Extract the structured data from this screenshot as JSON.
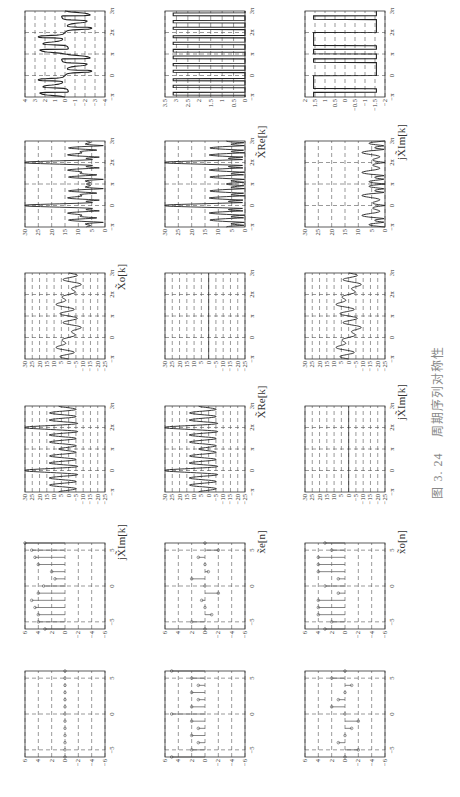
{
  "figure": {
    "caption_number": "图 3. 24",
    "caption_text": "周期序列对称性",
    "rows_labels": [
      {
        "left": "jX̃_Im[k]",
        "mid": "X̃_o[k]",
        "right": ""
      },
      {
        "left": "x̃_e[n]",
        "mid": "X̃_Re[k]",
        "right": "X̃_Re[k]"
      },
      {
        "left": "x̃_o[n]",
        "mid": "jX̃_Im[k]",
        "right": "jX̃_Im[k]"
      }
    ],
    "label_texts": {
      "r1": "jX̃Im[k]",
      "r1_mid": "X̃o[k]",
      "r2": "x̃e[n]",
      "r2_mid": "X̃Re[k]",
      "r2_right": "X̃Re[k]",
      "r3": "x̃o[n]",
      "r3_mid": "jX̃Im[k]",
      "r3_right": "jX̃Im[k]"
    }
  },
  "chart_data": [
    {
      "id": "r1c1",
      "type": "stem",
      "title": "",
      "xlabel": "",
      "ylabel": "",
      "xlim": [
        -6,
        6
      ],
      "ylim": [
        -6,
        6
      ],
      "xticks": [
        "-5",
        "0",
        "5"
      ],
      "yticks": [
        "6",
        "4",
        "2",
        "0",
        "-2",
        "-4",
        "-6"
      ],
      "x": [
        -6,
        -5,
        -4,
        -3,
        -2,
        -1,
        0,
        1,
        2,
        3,
        4,
        5,
        6
      ],
      "values": [
        0,
        0,
        0,
        0,
        0,
        0,
        0,
        0,
        0,
        0,
        0,
        0,
        0
      ]
    },
    {
      "id": "r1c2",
      "type": "stem",
      "title": "",
      "xlabel": "",
      "ylabel": "",
      "xlim": [
        -6,
        6
      ],
      "ylim": [
        -6,
        6
      ],
      "xticks": [
        "-5",
        "0",
        "5"
      ],
      "yticks": [
        "6",
        "4",
        "2",
        "0",
        "-2",
        "-4",
        "-6"
      ],
      "x": [
        -6,
        -5,
        -4,
        -3,
        -2,
        -1,
        0,
        1,
        2,
        3,
        4,
        5,
        6
      ],
      "values": [
        3,
        4,
        4,
        4.5,
        5,
        4,
        3.2,
        1.5,
        2,
        4,
        4.5,
        5,
        6
      ]
    },
    {
      "id": "r1c3",
      "type": "line",
      "title": "",
      "xlabel": "",
      "ylabel": "",
      "xlim": [
        "-π",
        "3π"
      ],
      "ylim": [
        -25,
        30
      ],
      "xticks": [
        "-π",
        "0",
        "π",
        "2π",
        "3π"
      ],
      "yticks": [
        "30",
        "25",
        "20",
        "15",
        "10",
        "5",
        "0",
        "-5",
        "-10",
        "-15",
        "-20",
        "-25"
      ],
      "shape": "real part of odd-symmetric spectrum, peaks ≈15 near 0 and 2π, dips ≈-13"
    },
    {
      "id": "r1c4",
      "type": "line",
      "title": "",
      "xlabel": "",
      "ylabel": "",
      "xlim": [
        "-π",
        "3π"
      ],
      "ylim": [
        -25,
        30
      ],
      "xticks": [
        "-π",
        "0",
        "π",
        "2π",
        "3π"
      ],
      "yticks": [
        "30",
        "25",
        "20",
        "15",
        "10",
        "5",
        "0",
        "-5",
        "-10",
        "-15",
        "-20",
        "-25"
      ],
      "shape": "odd part, peaks ≈20 at 0 and 2π, dips ≈-5"
    },
    {
      "id": "r1c5",
      "type": "line",
      "title": "",
      "xlabel": "",
      "ylabel": "",
      "xlim": [
        "-π",
        "3π"
      ],
      "ylim": [
        0,
        30
      ],
      "xticks": [
        "-π",
        "0",
        "π",
        "2π",
        "3π"
      ],
      "yticks": [
        "30",
        "25",
        "20",
        "15",
        "10",
        "5",
        "0"
      ],
      "shape": "magnitude, peaks 20 at 0 and 2π, ripples ≈3-5"
    },
    {
      "id": "r1c6",
      "type": "line",
      "title": "",
      "xlabel": "",
      "ylabel": "",
      "xlim": [
        "-π",
        "3π"
      ],
      "ylim": [
        -4,
        4
      ],
      "xticks": [
        "-π",
        "0",
        "π",
        "2π",
        "3π"
      ],
      "yticks": [
        "4",
        "3",
        "2",
        "1",
        "0",
        "-1",
        "-2",
        "-3",
        "-4"
      ],
      "shape": "phase sawtooth between -3 and 3"
    },
    {
      "id": "r2c1",
      "type": "stem",
      "title": "",
      "xlabel": "",
      "ylabel": "",
      "xlim": [
        -6,
        6
      ],
      "ylim": [
        -6,
        6
      ],
      "xticks": [
        "-5",
        "0",
        "5"
      ],
      "yticks": [
        "6",
        "4",
        "2",
        "0",
        "-2",
        "-4",
        "-6"
      ],
      "x": [
        -6,
        -5,
        -4,
        -3,
        -2,
        -1,
        0,
        1,
        2,
        3,
        4,
        5,
        6
      ],
      "values": [
        5,
        2,
        1,
        2,
        1,
        2,
        5,
        2,
        1,
        2,
        1,
        2,
        5
      ]
    },
    {
      "id": "r2c2",
      "type": "stem",
      "title": "",
      "xlabel": "",
      "ylabel": "",
      "xlim": [
        -6,
        6
      ],
      "ylim": [
        -6,
        6
      ],
      "xticks": [
        "-5",
        "0",
        "5"
      ],
      "yticks": [
        "6",
        "4",
        "2",
        "0",
        "-2",
        "-4",
        "-6"
      ],
      "x": [
        -6,
        -5,
        -4,
        -3,
        -2,
        -1,
        0,
        1,
        2,
        3,
        4,
        5,
        6
      ],
      "values": [
        0,
        2,
        -1,
        0,
        0.5,
        -2,
        0,
        2,
        -0.5,
        0,
        1,
        -2,
        0
      ]
    },
    {
      "id": "r2c3",
      "type": "line",
      "title": "",
      "xlabel": "",
      "ylabel": "",
      "xlim": [
        "-π",
        "3π"
      ],
      "ylim": [
        -25,
        30
      ],
      "xticks": [
        "-π",
        "0",
        "π",
        "2π",
        "3π"
      ],
      "yticks": [
        "30",
        "25",
        "20",
        "15",
        "10",
        "5",
        "0",
        "-5",
        "-10",
        "-15",
        "-20",
        "-25"
      ],
      "shape": "real part, peaks ≈25 at 0 and 2π, dips ≈-7"
    },
    {
      "id": "r2c4",
      "type": "line",
      "title": "",
      "xlabel": "",
      "ylabel": "",
      "xlim": [
        "-π",
        "3π"
      ],
      "ylim": [
        -25,
        30
      ],
      "xticks": [
        "-π",
        "0",
        "π",
        "2π",
        "3π"
      ],
      "yticks": [
        "30",
        "25",
        "20",
        "15",
        "10",
        "5",
        "0",
        "-5",
        "-10",
        "-15",
        "-20",
        "-25"
      ],
      "shape": "imag part identically 0"
    },
    {
      "id": "r2c5",
      "type": "line",
      "title": "",
      "xlabel": "",
      "ylabel": "",
      "xlim": [
        "-π",
        "3π"
      ],
      "ylim": [
        0,
        30
      ],
      "xticks": [
        "-π",
        "0",
        "π",
        "2π",
        "3π"
      ],
      "yticks": [
        "30",
        "25",
        "20",
        "15",
        "10",
        "5",
        "0"
      ],
      "shape": "magnitude, peaks ≈25 at 0 and 2π"
    },
    {
      "id": "r2c6",
      "type": "line",
      "title": "",
      "xlabel": "",
      "ylabel": "",
      "xlim": [
        "-π",
        "3π"
      ],
      "ylim": [
        0,
        3.5
      ],
      "xticks": [
        "-π",
        "0",
        "π",
        "2π",
        "3π"
      ],
      "yticks": [
        "3.5",
        "3",
        "2.5",
        "2",
        "1.5",
        "1",
        "0.5",
        "0"
      ],
      "shape": "phase 0 or π (≈3.14) rectangular pulses"
    },
    {
      "id": "r3c1",
      "type": "stem",
      "title": "",
      "xlabel": "",
      "ylabel": "",
      "xlim": [
        -6,
        6
      ],
      "ylim": [
        -6,
        6
      ],
      "xticks": [
        "-5",
        "0",
        "5"
      ],
      "yticks": [
        "6",
        "4",
        "2",
        "0",
        "-2",
        "-4",
        "-6"
      ],
      "x": [
        -6,
        -5,
        -4,
        -3,
        -2,
        -1,
        0,
        1,
        2,
        3,
        4,
        5,
        6
      ],
      "values": [
        0,
        -2,
        1,
        0,
        -1,
        -2,
        0,
        2,
        1,
        0,
        -1,
        2,
        0
      ]
    },
    {
      "id": "r3c2",
      "type": "stem",
      "title": "",
      "xlabel": "",
      "ylabel": "",
      "xlim": [
        -6,
        6
      ],
      "ylim": [
        -6,
        6
      ],
      "xticks": [
        "-5",
        "0",
        "5"
      ],
      "yticks": [
        "6",
        "4",
        "2",
        "0",
        "-2",
        "-4",
        "-6"
      ],
      "x": [
        -6,
        -5,
        -4,
        -3,
        -2,
        -1,
        0,
        1,
        2,
        3,
        4,
        5,
        6
      ],
      "values": [
        3,
        2,
        4,
        4,
        4,
        1,
        3,
        1,
        4,
        4,
        4,
        2,
        3
      ]
    },
    {
      "id": "r3c3",
      "type": "line",
      "title": "",
      "xlabel": "",
      "ylabel": "",
      "xlim": [
        "-π",
        "3π"
      ],
      "ylim": [
        -25,
        30
      ],
      "xticks": [
        "-π",
        "0",
        "π",
        "2π",
        "3π"
      ],
      "yticks": [
        "30",
        "25",
        "20",
        "15",
        "10",
        "5",
        "0",
        "-5",
        "-10",
        "-15",
        "-20",
        "-25"
      ],
      "shape": "real part identically 0"
    },
    {
      "id": "r3c4",
      "type": "line",
      "title": "",
      "xlabel": "",
      "ylabel": "",
      "xlim": [
        "-π",
        "3π"
      ],
      "ylim": [
        -25,
        30
      ],
      "xticks": [
        "-π",
        "0",
        "π",
        "2π",
        "3π"
      ],
      "yticks": [
        "30",
        "25",
        "20",
        "15",
        "10",
        "5",
        "0",
        "-5",
        "-10",
        "-15",
        "-20",
        "-25"
      ],
      "shape": "imag part, peaks ≈20 at 0 and 2π, dips ≈-10"
    },
    {
      "id": "r3c5",
      "type": "line",
      "title": "",
      "xlabel": "",
      "ylabel": "",
      "xlim": [
        "-π",
        "3π"
      ],
      "ylim": [
        0,
        30
      ],
      "xticks": [
        "-π",
        "0",
        "π",
        "2π",
        "3π"
      ],
      "yticks": [
        "30",
        "25",
        "20",
        "15",
        "10",
        "5",
        "0"
      ],
      "shape": "magnitude, peaks ≈21 at 0 and 2π"
    },
    {
      "id": "r3c6",
      "type": "line",
      "title": "",
      "xlabel": "",
      "ylabel": "",
      "xlim": [
        "-π",
        "3π"
      ],
      "ylim": [
        -2,
        2
      ],
      "xticks": [
        "-π",
        "0",
        "π",
        "2π",
        "3π"
      ],
      "yticks": [
        "2",
        "1.5",
        "1",
        "0.5",
        "0",
        "-0.5",
        "-1",
        "-1.5",
        "-2"
      ],
      "shape": "phase ±π/2 (≈±1.57) rectangular"
    }
  ]
}
